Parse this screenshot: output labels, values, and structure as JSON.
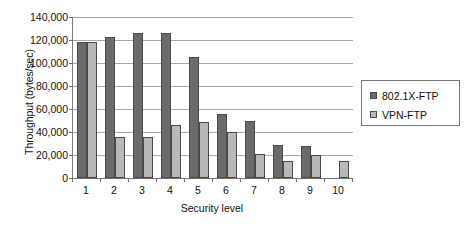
{
  "chart_data": {
    "type": "bar",
    "title": "",
    "subtitle": "",
    "xlabel": "Security level",
    "ylabel": "Throughput (bytes/sec)",
    "categories": [
      "1",
      "2",
      "3",
      "4",
      "5",
      "6",
      "7",
      "8",
      "9",
      "10"
    ],
    "series": [
      {
        "name": "802.1X-FTP",
        "color": "#6b6b6b",
        "values": [
          118000,
          123000,
          126500,
          126000,
          105000,
          55500,
          50000,
          28500,
          27500,
          null
        ]
      },
      {
        "name": "VPN-FTP",
        "color": "#b8b8b8",
        "values": [
          118000,
          35500,
          35500,
          46000,
          49000,
          40000,
          21000,
          14500,
          20000,
          14500
        ]
      }
    ],
    "ylim": [
      0,
      140000
    ],
    "ytick_values": [
      0,
      20000,
      40000,
      60000,
      80000,
      100000,
      120000,
      140000
    ],
    "ytick_labels": [
      "0",
      "20,000",
      "40,000",
      "60,000",
      "80,000",
      "100,000",
      "120,000",
      "140,000"
    ],
    "grid": true,
    "grid_axis": "y",
    "legend_position": "right",
    "background_color": "#ffffff"
  },
  "legend": {
    "entries": [
      {
        "label": "802.1X-FTP",
        "swatch_name": "legend-swatch-802-1x-ftp"
      },
      {
        "label": "VPN-FTP",
        "swatch_name": "legend-swatch-vpn-ftp"
      }
    ]
  }
}
